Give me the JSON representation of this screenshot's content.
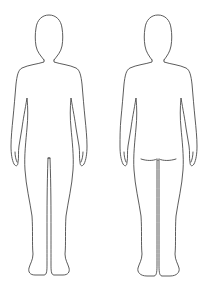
{
  "diagram": {
    "title": "Body outline chart",
    "figures": [
      {
        "view": "Front",
        "description": "Front view of human body outline"
      },
      {
        "view": "Back",
        "description": "Back view of human body outline"
      }
    ],
    "stroke_color": "#4a4a4a",
    "background_color": "#ffffff"
  }
}
